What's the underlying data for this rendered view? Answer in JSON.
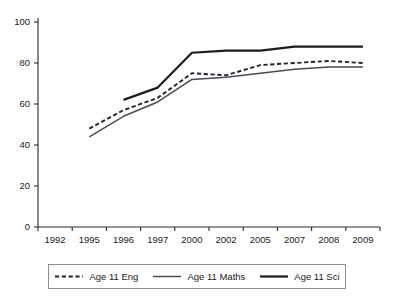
{
  "chart_data": {
    "type": "line",
    "title": "",
    "xlabel": "",
    "ylabel": "",
    "ylim": [
      0,
      100
    ],
    "yticks": [
      0,
      20,
      40,
      60,
      80,
      100
    ],
    "grid": false,
    "legend_position": "bottom",
    "categories": [
      "1992",
      "1995",
      "1996",
      "1997",
      "2000",
      "2002",
      "2005",
      "2007",
      "2008",
      "2009"
    ],
    "series": [
      {
        "name": "Age 11 Eng",
        "style": "dashed",
        "color": "#23232b",
        "values": [
          null,
          48,
          57,
          63,
          75,
          74,
          79,
          80,
          81,
          80
        ]
      },
      {
        "name": "Age 11 Maths",
        "style": "solid-thin",
        "color": "#4a4a52",
        "values": [
          null,
          44,
          54,
          61,
          72,
          73,
          75,
          77,
          78,
          78
        ]
      },
      {
        "name": "Age 11 Sci",
        "style": "solid-thick",
        "color": "#1b1b22",
        "values": [
          null,
          null,
          62,
          68,
          85,
          86,
          86,
          88,
          88,
          88
        ]
      }
    ]
  },
  "axes": {
    "y_tick_labels": [
      "0",
      "20",
      "40",
      "60",
      "80",
      "100"
    ],
    "x_tick_labels": [
      "1992",
      "1995",
      "1996",
      "1997",
      "2000",
      "2002",
      "2005",
      "2007",
      "2008",
      "2009"
    ]
  },
  "legend": {
    "items": [
      {
        "label": "Age 11 Eng",
        "style": "dashed"
      },
      {
        "label": "Age 11 Maths",
        "style": "solid-thin"
      },
      {
        "label": "Age 11 Sci",
        "style": "solid-thick"
      }
    ]
  }
}
